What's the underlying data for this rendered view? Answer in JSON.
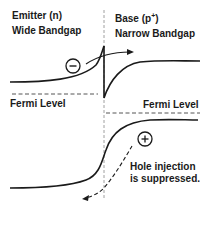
{
  "emitter": {
    "title": "Emitter (n)",
    "subtitle": "Wide Bandgap"
  },
  "base": {
    "title_prefix": "Base (p",
    "title_sup": "+",
    "title_suffix": ")",
    "subtitle": "Narrow Bandgap"
  },
  "fermi_left": "Fermi Level",
  "fermi_right": "Fermi Level",
  "hole_note": {
    "line1": "Hole injection",
    "line2": "is suppressed."
  },
  "symbols": {
    "electron": "−",
    "hole": "+"
  },
  "colors": {
    "line": "#1a1a1a",
    "dashed": "#555555"
  }
}
